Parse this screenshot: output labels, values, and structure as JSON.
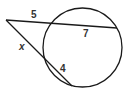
{
  "diagram": {
    "type": "geometry-secant-secant",
    "colors": {
      "stroke": "#1a1a1a",
      "label": "#333333",
      "background": "#ffffff"
    },
    "circle": {
      "cx": 82.5,
      "cy": 47.5,
      "r": 39.5
    },
    "vertex": {
      "x": 6,
      "y": 20
    },
    "secant_upper": {
      "near": {
        "x": 51,
        "y": 24
      },
      "far": {
        "x": 117,
        "y": 28
      }
    },
    "secant_lower": {
      "near": {
        "x": 46,
        "y": 59
      },
      "far": {
        "x": 72,
        "y": 86
      }
    },
    "labels": {
      "upper_external": {
        "text": "5",
        "x": 31,
        "y": 18
      },
      "upper_internal": {
        "text": "7",
        "x": 83,
        "y": 37
      },
      "lower_external": {
        "text": "x",
        "x": 19,
        "y": 50
      },
      "lower_internal": {
        "text": "4",
        "x": 60,
        "y": 72
      }
    }
  }
}
